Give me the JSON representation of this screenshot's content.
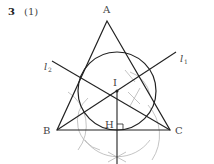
{
  "problem": {
    "number": "3",
    "part": "(1)"
  },
  "diagram": {
    "points": {
      "A": {
        "label": "A",
        "x": 107,
        "y": 21
      },
      "B": {
        "label": "B",
        "x": 57,
        "y": 130
      },
      "C": {
        "label": "C",
        "x": 170,
        "y": 130
      },
      "I": {
        "label": "I",
        "x": 117,
        "y": 91
      },
      "H": {
        "label": "H",
        "x": 117,
        "y": 130
      }
    },
    "lines": {
      "l1": {
        "label": "l",
        "subscript": "1"
      },
      "l2": {
        "label": "l",
        "subscript": "2"
      }
    },
    "incircle_radius": 39,
    "colors": {
      "stroke": "#222222",
      "construction": "#999999",
      "label": "#444444"
    }
  }
}
